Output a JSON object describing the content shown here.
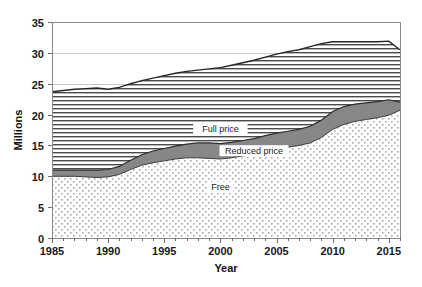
{
  "chart_data": {
    "type": "area",
    "stacked": true,
    "title": "",
    "xlabel": "Year",
    "ylabel": "Millions",
    "xlim": [
      1985,
      2016
    ],
    "ylim": [
      0,
      35
    ],
    "ytick_step": 5,
    "yticks": [
      0,
      5,
      10,
      15,
      20,
      25,
      30,
      35
    ],
    "xticks_labeled": [
      1985,
      1990,
      1995,
      2000,
      2005,
      2010,
      2015
    ],
    "xtick_step_minor": 1,
    "grid": "horizontal",
    "legend_position": "inline-annotations",
    "x": [
      1985,
      1986,
      1987,
      1988,
      1989,
      1990,
      1991,
      1992,
      1993,
      1994,
      1995,
      1996,
      1997,
      1998,
      1999,
      2000,
      2001,
      2002,
      2003,
      2004,
      2005,
      2006,
      2007,
      2008,
      2009,
      2010,
      2011,
      2012,
      2013,
      2014,
      2015,
      2016
    ],
    "series": [
      {
        "name": "Free",
        "pattern": "dots",
        "color": "#f2f2f2",
        "values": [
          10.0,
          10.0,
          10.0,
          9.9,
          9.8,
          9.9,
          10.3,
          11.1,
          11.8,
          12.2,
          12.5,
          12.8,
          13.0,
          13.0,
          12.9,
          12.8,
          13.0,
          13.3,
          13.6,
          14.0,
          14.4,
          14.7,
          15.0,
          15.4,
          16.3,
          17.6,
          18.4,
          18.9,
          19.2,
          19.5,
          19.9,
          20.7
        ]
      },
      {
        "name": "Reduced price",
        "pattern": "solid-gray",
        "color": "#808080",
        "values": [
          1.0,
          1.0,
          1.0,
          1.1,
          1.2,
          1.2,
          1.3,
          1.5,
          1.7,
          1.9,
          2.0,
          2.1,
          2.2,
          2.4,
          2.5,
          2.5,
          2.5,
          2.5,
          2.5,
          2.6,
          2.6,
          2.6,
          2.6,
          2.7,
          2.8,
          2.9,
          2.9,
          2.8,
          2.7,
          2.6,
          2.5,
          1.3
        ]
      },
      {
        "name": "Full price",
        "pattern": "horizontal-lines",
        "color": "#ffffff",
        "values": [
          12.7,
          12.9,
          13.1,
          13.2,
          13.3,
          13.0,
          12.8,
          12.4,
          12.0,
          11.8,
          11.8,
          11.8,
          11.8,
          11.8,
          12.0,
          12.3,
          12.5,
          12.6,
          12.7,
          12.7,
          12.8,
          12.9,
          12.9,
          12.9,
          12.4,
          11.3,
          10.5,
          10.1,
          9.9,
          9.7,
          9.5,
          8.5
        ]
      }
    ],
    "totals": [
      23.7,
      23.9,
      24.1,
      24.2,
      24.3,
      24.1,
      24.4,
      25.0,
      25.5,
      25.9,
      26.3,
      26.7,
      27.0,
      27.2,
      27.4,
      27.6,
      28.0,
      28.4,
      28.8,
      29.3,
      29.8,
      30.2,
      30.5,
      31.0,
      31.5,
      31.8,
      31.8,
      31.8,
      31.8,
      31.8,
      31.9,
      30.5
    ],
    "annotations": [
      {
        "text": "Full price",
        "x": 2000,
        "y": 17.5
      },
      {
        "text": "Reduced price",
        "x": 2003,
        "y": 13.9
      },
      {
        "text": "Free",
        "x": 2000,
        "y": 8.0
      }
    ]
  },
  "axes": {
    "ylabel": "Millions",
    "xlabel": "Year",
    "ytick_labels": [
      "0",
      "5",
      "10",
      "15",
      "20",
      "25",
      "30",
      "35"
    ],
    "xtick_labels": [
      "1985",
      "1990",
      "1995",
      "2000",
      "2005",
      "2010",
      "2015"
    ]
  },
  "series_labels": {
    "full_price": "Full price",
    "reduced_price": "Reduced price",
    "free": "Free"
  },
  "colors": {
    "axis": "#808080",
    "grid": "#c8c8c8",
    "reduced": "#808080",
    "hatch": "#4d4d4d",
    "dots": "#b4b4b4",
    "text": "#1a1a1a",
    "boundary": "#2b2b2b"
  }
}
